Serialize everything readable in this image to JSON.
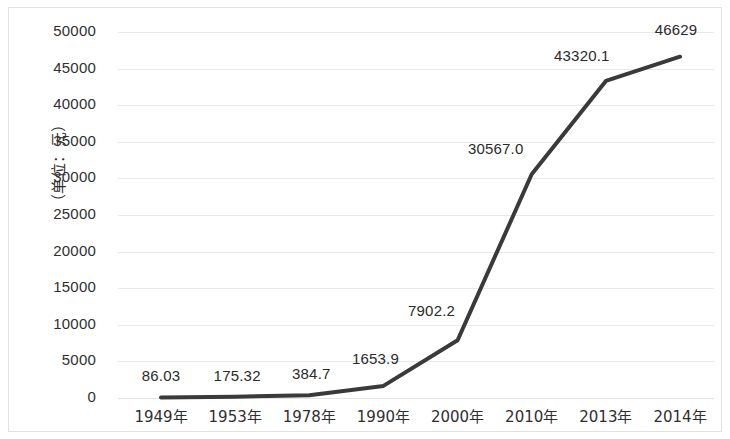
{
  "chart_data": {
    "type": "line",
    "title": "",
    "subtitle": "",
    "xlabel": "",
    "ylabel": "（单位：元）",
    "categories": [
      "1949年",
      "1953年",
      "1978年",
      "1990年",
      "2000年",
      "2010年",
      "2013年",
      "2014年"
    ],
    "values": [
      86.03,
      175.32,
      384.7,
      1653.9,
      7902.2,
      30567.0,
      43320.1,
      46629
    ],
    "point_labels": [
      "86.03",
      "175.32",
      "384.7",
      "1653.9",
      "7902.2",
      "30567.0",
      "43320.1",
      "46629"
    ],
    "ylim": [
      0,
      50000
    ],
    "ytick_values": [
      0,
      5000,
      10000,
      15000,
      20000,
      25000,
      30000,
      35000,
      40000,
      45000,
      50000
    ],
    "ytick_labels": [
      "0",
      "5000",
      "10000",
      "15000",
      "20000",
      "25000",
      "30000",
      "35000",
      "40000",
      "45000",
      "50000"
    ],
    "grid": true,
    "grid_axis": "y",
    "legend": false,
    "legend_position": "none",
    "series": [
      {
        "name": "",
        "color": "#3a3a3a",
        "line_width": 4,
        "markers": false,
        "values": [
          86.03,
          175.32,
          384.7,
          1653.9,
          7902.2,
          30567.0,
          43320.1,
          46629
        ]
      }
    ]
  },
  "colors": {
    "line": "#3a3a3a",
    "grid": "#e9e9e9",
    "frame": "#e2e2e2",
    "text": "#2f2f2f",
    "background": "#ffffff"
  }
}
